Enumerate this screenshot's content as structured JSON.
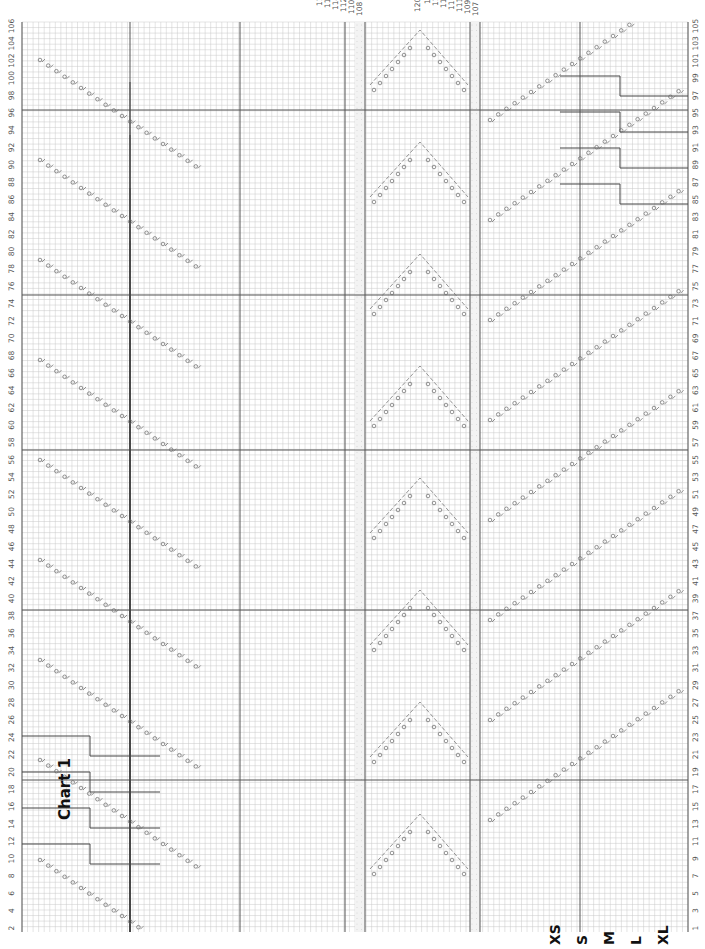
{
  "chart_title": "Chart 1",
  "sizes": [
    "XS",
    "S",
    "M",
    "L",
    "XL"
  ],
  "row_labels_left_even": [
    "106",
    "104",
    "102",
    "100",
    "98",
    "96",
    "94",
    "92",
    "90",
    "88",
    "86",
    "84",
    "82",
    "80",
    "78",
    "76",
    "74",
    "72",
    "70",
    "68",
    "66",
    "64",
    "62",
    "60",
    "58",
    "56",
    "54",
    "52",
    "50",
    "48",
    "46",
    "44",
    "42",
    "40",
    "38",
    "36",
    "34",
    "32",
    "30",
    "28",
    "26",
    "24",
    "22",
    "20",
    "18",
    "16",
    "14",
    "12",
    "10",
    "8",
    "6",
    "4",
    "2"
  ],
  "row_labels_right_odd": [
    "105",
    "103",
    "101",
    "99",
    "97",
    "95",
    "93",
    "91",
    "89",
    "87",
    "85",
    "83",
    "81",
    "79",
    "77",
    "75",
    "73",
    "71",
    "69",
    "67",
    "65",
    "63",
    "61",
    "59",
    "57",
    "55",
    "53",
    "51",
    "49",
    "47",
    "45",
    "43",
    "41",
    "39",
    "37",
    "35",
    "33",
    "31",
    "29",
    "27",
    "25",
    "23",
    "21",
    "19",
    "17",
    "15",
    "13",
    "11",
    "9",
    "7",
    "5",
    "3",
    "1"
  ],
  "peak_labels_left": [
    "108",
    "110",
    "112",
    "114",
    "116",
    "118"
  ],
  "peak_labels_right": [
    "107",
    "109",
    "111",
    "113",
    "115",
    "117",
    "119"
  ],
  "peak_label_top": "120",
  "symbols": {
    "yarn_over": "circle",
    "k2tog": "slash-right",
    "ssk": "slash-left",
    "no_stitch": "dotted-cell",
    "bobble": "filled-square"
  },
  "colors": {
    "grid_fine": "#c8c8c8",
    "grid_major": "#555555",
    "symbol": "#666666",
    "dotted_band": "#bbbbbb"
  }
}
